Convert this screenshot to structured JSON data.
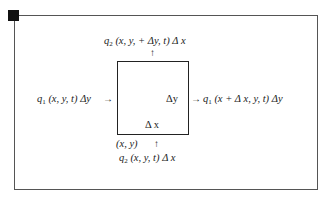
{
  "diagram": {
    "type": "control-volume flux diagram",
    "labels": {
      "top_flux": "q2 (x, y, + Δy, t) Δx",
      "left_flux": "q1 (x, y, t) Δy",
      "right_flux": "q1 (x + Δx, y, t) Δy",
      "bottom_flux": "q2 (x, y, t) Δx",
      "width_label": "Δ x",
      "height_label": "Δy",
      "origin_label": "(x, y)"
    },
    "parts": {
      "top_q": "q",
      "top_sub": "2",
      "top_rest": " (x, y, + Δy, t) Δ x",
      "left_q": "q",
      "left_sub": "1",
      "left_rest": " (x, y, t) Δy",
      "right_q": "q",
      "right_sub": "1",
      "right_rest": " (x + Δ x, y, t) Δy",
      "bottom_q": "q",
      "bottom_sub": "2",
      "bottom_rest": " (x, y, t) Δ x"
    },
    "arrows": {
      "up": "↑",
      "right": "→"
    }
  }
}
